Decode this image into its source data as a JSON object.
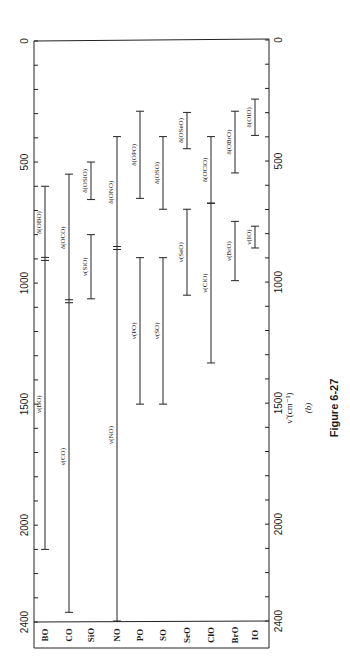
{
  "chart_data": {
    "type": "range-bar",
    "orientation": "rotated-90",
    "title": "Figure 6-27",
    "subtitle": "(b)",
    "xlabel": "ν̃ (cm⁻¹)",
    "axis_ticks": [
      0,
      500,
      1000,
      1500,
      2000,
      2400
    ],
    "axis_range": [
      0,
      2400
    ],
    "minor_tick_step": 100,
    "categories": [
      "BO",
      "CO",
      "SiO",
      "NO",
      "PO",
      "SO",
      "SeO",
      "ClO",
      "BrO",
      "IO"
    ],
    "series": [
      {
        "category": "BO",
        "bars": [
          {
            "label": "δ(OBO)",
            "start": 600,
            "end": 900
          },
          {
            "label": "ν(BO)",
            "start": 900,
            "end": 2100
          }
        ],
        "break_at": 900
      },
      {
        "category": "CO",
        "bars": [
          {
            "label": "δ(OCO)",
            "start": 550,
            "end": 1075
          },
          {
            "label": "ν(CO)",
            "start": 1075,
            "end": 2360
          }
        ],
        "break_at": 1075
      },
      {
        "category": "SiO",
        "bars": [
          {
            "label": "δ(OSiO)",
            "start": 500,
            "end": 655
          },
          {
            "label": "ν(SiO)",
            "start": 800,
            "end": 1065
          }
        ]
      },
      {
        "category": "NO",
        "bars": [
          {
            "label": "δ(ONO)",
            "start": 395,
            "end": 855
          },
          {
            "label": "ν(NO)",
            "start": 855,
            "end": 2400
          }
        ],
        "break_at": 855
      },
      {
        "category": "PO",
        "bars": [
          {
            "label": "δ(OPO)",
            "start": 290,
            "end": 650
          },
          {
            "label": "ν(PO)",
            "start": 895,
            "end": 1500
          }
        ]
      },
      {
        "category": "SO",
        "bars": [
          {
            "label": "δ(OSO)",
            "start": 395,
            "end": 695
          },
          {
            "label": "ν(SO)",
            "start": 895,
            "end": 1500
          }
        ]
      },
      {
        "category": "SeO",
        "bars": [
          {
            "label": "δ(OSeO)",
            "start": 295,
            "end": 445
          },
          {
            "label": "ν(SeO)",
            "start": 695,
            "end": 1050
          }
        ]
      },
      {
        "category": "ClO",
        "bars": [
          {
            "label": "δ(OClO)",
            "start": 395,
            "end": 670
          },
          {
            "label": "ν(ClO)",
            "start": 670,
            "end": 1330
          }
        ]
      },
      {
        "category": "BrO",
        "bars": [
          {
            "label": "δ(OBrO)",
            "start": 290,
            "end": 545
          },
          {
            "label": "ν(BrO)",
            "start": 745,
            "end": 990
          }
        ]
      },
      {
        "category": "IO",
        "bars": [
          {
            "label": "δ(OIO)",
            "start": 240,
            "end": 390
          },
          {
            "label": "ν(IO)",
            "start": 765,
            "end": 855
          }
        ]
      }
    ],
    "grid": false,
    "legend": "none"
  },
  "figure": {
    "caption": "Figure 6-27",
    "panel": "(b)",
    "axis_title": "ν̃ (cm⁻¹)"
  }
}
